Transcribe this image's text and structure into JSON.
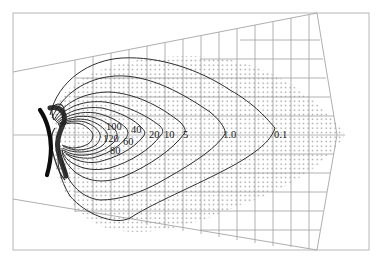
{
  "figure": {
    "type": "contour-diagram",
    "colors": {
      "background": "#ffffff",
      "frame": "#b5b5b5",
      "grid": "#9a9a9a",
      "dots": "#8a8a8a",
      "contour": "#2a2a2a",
      "source_bar": "#111111"
    }
  },
  "contour_labels": [
    {
      "id": "c100",
      "text": "100"
    },
    {
      "id": "c120",
      "text": "120"
    },
    {
      "id": "c80",
      "text": "80"
    },
    {
      "id": "c40",
      "text": "40"
    },
    {
      "id": "c60",
      "text": "60"
    },
    {
      "id": "c20",
      "text": "20"
    },
    {
      "id": "c10",
      "text": "10"
    },
    {
      "id": "c5",
      "text": "5"
    },
    {
      "id": "c1",
      "text": "1.0"
    },
    {
      "id": "c01",
      "text": "0.1"
    }
  ],
  "contour_levels": [
    120,
    100,
    80,
    60,
    40,
    20,
    10,
    5,
    1.0,
    0.1
  ]
}
